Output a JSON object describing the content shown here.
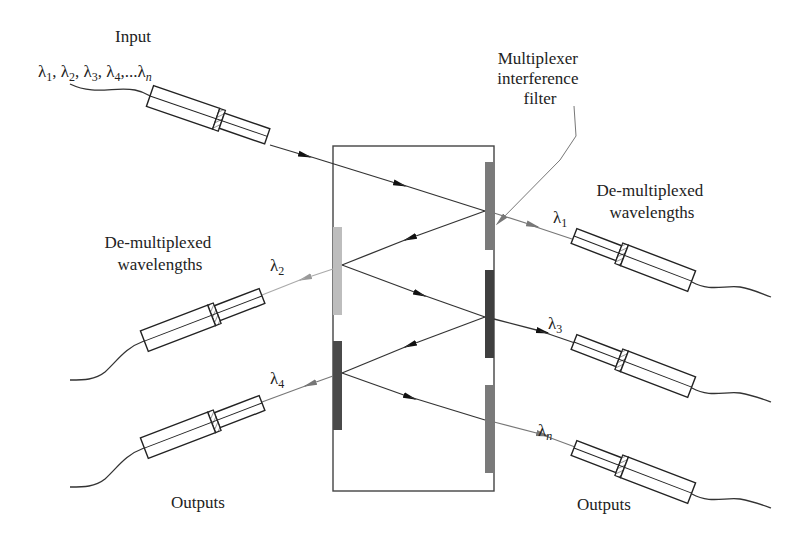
{
  "labels": {
    "input_title": "Input",
    "input_wavelengths": [
      {
        "sym": "λ",
        "sub": "1",
        "sep": ", "
      },
      {
        "sym": "λ",
        "sub": "2",
        "sep": ", "
      },
      {
        "sym": "λ",
        "sub": "3",
        "sep": ", "
      },
      {
        "sym": "λ",
        "sub": "4",
        "sep": ",..."
      },
      {
        "sym": "λ",
        "sub": "n",
        "sep": ""
      }
    ],
    "filter_callout": [
      "Multiplexer",
      "interference",
      "filter"
    ],
    "demux_right": [
      "De-multiplexed",
      "wavelengths"
    ],
    "demux_left": [
      "De-multiplexed",
      "wavelengths"
    ],
    "outputs_left": "Outputs",
    "outputs_right": "Outputs"
  },
  "beams": {
    "lambda1": {
      "sym": "λ",
      "sub": "1"
    },
    "lambda2": {
      "sym": "λ",
      "sub": "2"
    },
    "lambda3": {
      "sym": "λ",
      "sub": "3"
    },
    "lambda4": {
      "sym": "λ",
      "sub": "4"
    },
    "lambdan": {
      "sym": "λ",
      "sub": "n"
    }
  },
  "colors": {
    "filter_light": "#bdbdbd",
    "filter_medium": "#7a7a7a",
    "filter_dark": "#3f3f3f",
    "line": "#333333"
  }
}
